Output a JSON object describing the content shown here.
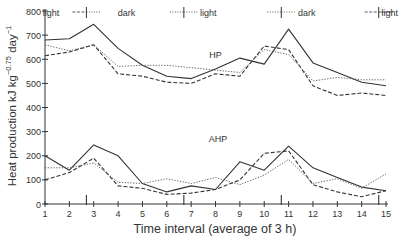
{
  "chart_data": {
    "type": "line",
    "title": "",
    "xlabel": "Time interval (average of 3 h)",
    "ylabel": "Heat production kJ kg^-0.75 day^-1",
    "ylabel_main": "Heat production kJ kg",
    "ylabel_exp1": "−0.75",
    "ylabel_mid": " day",
    "ylabel_exp2": "−1",
    "x": [
      1,
      2,
      3,
      4,
      5,
      6,
      7,
      8,
      9,
      10,
      11,
      12,
      13,
      14,
      15
    ],
    "xlim": [
      1,
      15
    ],
    "ylim": [
      0,
      800
    ],
    "yticks": [
      0,
      100,
      200,
      300,
      400,
      500,
      600,
      700,
      800
    ],
    "grid": false,
    "annotations": [
      {
        "text": "HP",
        "x": 8.0,
        "y": 605
      },
      {
        "text": "AHP",
        "x": 8.1,
        "y": 255
      }
    ],
    "phase_labels": [
      {
        "text": "light",
        "x": 1.25
      },
      {
        "text": "dark",
        "x": 4.35
      },
      {
        "text": "light",
        "x": 7.7
      },
      {
        "text": "dark",
        "x": 11.75
      },
      {
        "text": "light",
        "x": 15.15
      }
    ],
    "phase_markers": [
      2.7,
      6.7,
      10.7,
      14.7
    ],
    "series": [
      {
        "name": "HP solid",
        "group": "HP",
        "style": "solid",
        "values": [
          680,
          685,
          745,
          645,
          575,
          530,
          520,
          560,
          605,
          580,
          725,
          585,
          545,
          505,
          490
        ]
      },
      {
        "name": "HP dashed",
        "group": "HP",
        "style": "dashed",
        "values": [
          615,
          630,
          660,
          540,
          530,
          505,
          500,
          540,
          530,
          655,
          640,
          490,
          450,
          460,
          450
        ]
      },
      {
        "name": "HP dotted",
        "group": "HP",
        "style": "dotted",
        "values": [
          660,
          635,
          660,
          570,
          575,
          575,
          565,
          555,
          545,
          640,
          620,
          510,
          525,
          515,
          515
        ]
      },
      {
        "name": "AHP solid",
        "group": "AHP",
        "style": "solid",
        "values": [
          200,
          140,
          245,
          200,
          85,
          50,
          75,
          60,
          175,
          140,
          240,
          150,
          110,
          70,
          55
        ]
      },
      {
        "name": "AHP dashed",
        "group": "AHP",
        "style": "dashed",
        "values": [
          100,
          130,
          190,
          75,
          65,
          40,
          45,
          60,
          100,
          210,
          220,
          80,
          50,
          30,
          55
        ]
      },
      {
        "name": "AHP dotted",
        "group": "AHP",
        "style": "dotted",
        "values": [
          150,
          150,
          170,
          90,
          85,
          105,
          85,
          110,
          80,
          120,
          185,
          85,
          105,
          65,
          125
        ]
      }
    ]
  }
}
